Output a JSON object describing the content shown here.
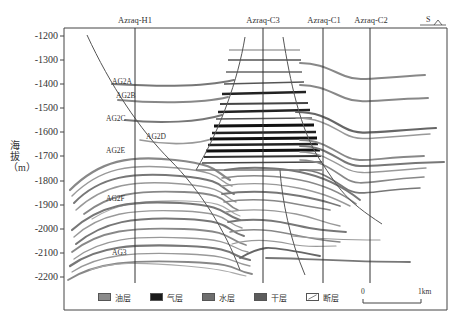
{
  "figure": {
    "type": "geological cross-section",
    "y_axis": {
      "label": "海拔（m）",
      "ticks": [
        "-1200",
        "-1300",
        "-1400",
        "-1500",
        "-1600",
        "-1700",
        "-1800",
        "-1900",
        "-2000",
        "-2100",
        "-2200"
      ],
      "range": [
        -1200,
        -2200
      ]
    },
    "wells": [
      {
        "name": "Azraq-H1"
      },
      {
        "name": "Azraq-C3"
      },
      {
        "name": "Azraq-C1"
      },
      {
        "name": "Azraq-C2"
      }
    ],
    "direction": {
      "label": "S"
    },
    "strata_labels": [
      {
        "name": "AG2A"
      },
      {
        "name": "AG2B"
      },
      {
        "name": "AG2C"
      },
      {
        "name": "AG2D"
      },
      {
        "name": "AG2E"
      },
      {
        "name": "AG2F"
      },
      {
        "name": "AG3"
      }
    ],
    "legend": [
      {
        "label": "油层",
        "color": "#8a8a8a",
        "type": "oil-layer"
      },
      {
        "label": "气层",
        "color": "#1a1a1a",
        "type": "gas-layer"
      },
      {
        "label": "水层",
        "color": "#6e6e6e",
        "type": "water-layer"
      },
      {
        "label": "干层",
        "color": "#5c5c5c",
        "type": "dry-layer"
      },
      {
        "label": "断层",
        "color": "#ffffff",
        "type": "fault"
      }
    ],
    "scale": {
      "start": "0",
      "end": "1km"
    }
  },
  "colors": {
    "frame": "#333333",
    "oil": "#8a8a8a",
    "gas": "#1a1a1a",
    "water": "#6e6e6e",
    "fault": "#555555"
  }
}
